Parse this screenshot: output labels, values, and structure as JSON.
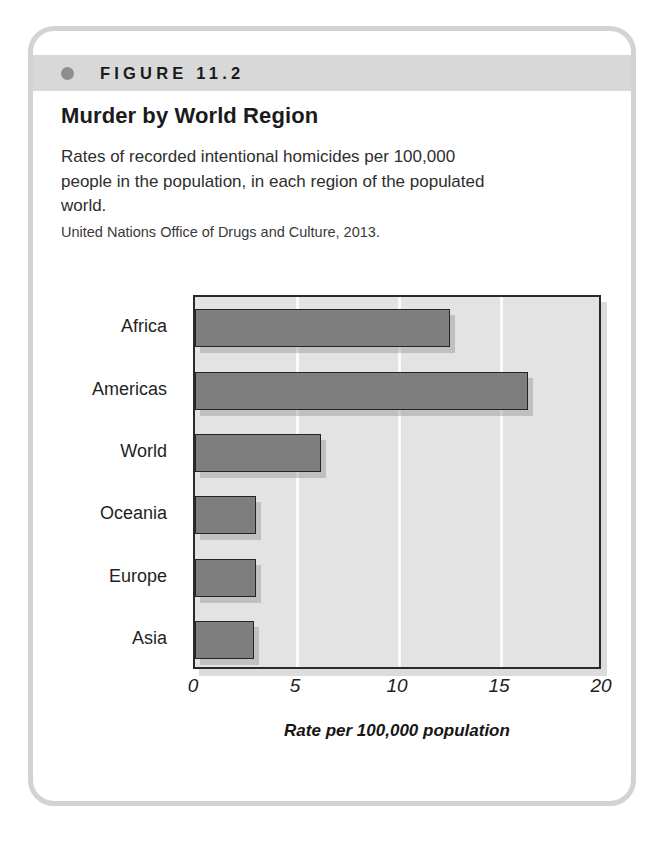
{
  "figure": {
    "label": "FIGURE 11.2",
    "bullet_icon": "bullet-dot-icon",
    "title": "Murder by World Region",
    "description": "Rates of recorded intentional homicides per 100,000 people in the population, in each region of the populated world.",
    "source": "United Nations Office of Drugs and Culture, 2013."
  },
  "colors": {
    "card_border": "#d3d3d3",
    "header_bar": "#d8d8d8",
    "bullet": "#8e8e8e",
    "plot_background": "#e3e3e3",
    "bar_fill": "#7e7e7e",
    "bar_stroke": "#242424",
    "gridline": "#fbfbfb",
    "axis": "#2a2a2a"
  },
  "chart_data": {
    "type": "bar",
    "orientation": "horizontal",
    "title": "Murder by World Region",
    "subtitle": "Rates of recorded intentional homicides per 100,000 people in the population, in each region of the populated world.",
    "source": "United Nations Office of Drugs and Culture, 2013.",
    "categories": [
      "Africa",
      "Americas",
      "World",
      "Oceania",
      "Europe",
      "Asia"
    ],
    "values": [
      12.5,
      16.3,
      6.2,
      3.0,
      3.0,
      2.9
    ],
    "xlabel": "Rate per 100,000 population",
    "ylabel": "",
    "xlim": [
      0,
      20
    ],
    "xticks": [
      0,
      5,
      10,
      15,
      20
    ],
    "xtick_labels": [
      "0",
      "5",
      "10",
      "15",
      "20"
    ],
    "grid": "vertical-white-gridlines-at-5-10-15",
    "legend": "none"
  }
}
